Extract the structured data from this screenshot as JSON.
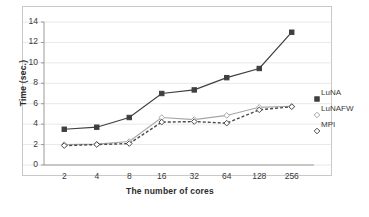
{
  "chart_data": {
    "type": "line",
    "title": "",
    "xlabel": "The number of cores",
    "ylabel": "Time (sec.)",
    "categories": [
      "2",
      "4",
      "8",
      "16",
      "32",
      "64",
      "128",
      "256"
    ],
    "ylim": [
      0,
      14
    ],
    "yticks": [
      "0",
      "2",
      "4",
      "6",
      "8",
      "10",
      "12",
      "14"
    ],
    "grid": true,
    "legend_position": "right",
    "series": [
      {
        "name": "LuNA",
        "color": "#3f3f3f",
        "style": "solid",
        "marker": "square",
        "values": [
          3.5,
          3.7,
          4.65,
          7.0,
          7.35,
          8.55,
          9.45,
          13.0
        ]
      },
      {
        "name": "LuNAFW",
        "color": "#a6a6a6",
        "style": "solid",
        "marker": "diamond",
        "values": [
          2.0,
          2.05,
          2.3,
          4.65,
          4.45,
          4.85,
          5.65,
          5.75
        ]
      },
      {
        "name": "MPI",
        "color": "#4a4a4a",
        "style": "dashed",
        "marker": "diamond",
        "values": [
          1.9,
          2.0,
          2.1,
          4.2,
          4.25,
          4.1,
          5.4,
          5.7
        ]
      }
    ]
  },
  "legend": {
    "items": [
      {
        "label": "LuNA"
      },
      {
        "label": "LuNAFW"
      },
      {
        "label": "MPI"
      }
    ]
  },
  "colors": {
    "axis": "#c9c9c9",
    "grid": "#e8e8e8",
    "text": "#3a3a3a",
    "background": "#ffffff"
  }
}
